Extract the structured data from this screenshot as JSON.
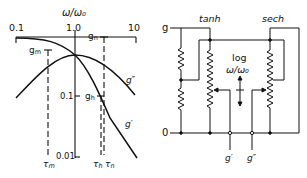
{
  "left_plot": {
    "x_axis_title": "ω/ω₀",
    "x_ticks": [
      "0.1",
      "1.0",
      "10"
    ],
    "y_ticks": [
      "0.1",
      "0.01"
    ],
    "curve_labels": {
      "g_double_prime": "g″",
      "g_prime": "g′"
    },
    "markers": {
      "g_m": "g",
      "g_m_sub": "m",
      "g_n": "g",
      "g_n_sub": "n",
      "g_h": "g",
      "g_h_sub": "h"
    },
    "tau_labels": {
      "tau_m": "τ",
      "tau_m_sub": "m",
      "tau_h": "τ",
      "tau_h_sub": "h",
      "tau_n": "τ",
      "tau_n_sub": "n"
    }
  },
  "right_circuit": {
    "top_rail_label": "g",
    "bottom_rail_label": "0",
    "tanh_label": "tanh",
    "sech_label": "sech",
    "center_label_line1": "log",
    "center_label_line2": "ω/ω₀",
    "output_labels": [
      "g′",
      "g″"
    ]
  },
  "colors": {
    "ink": "#111111",
    "background": "#ffffff"
  }
}
